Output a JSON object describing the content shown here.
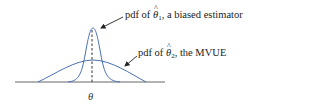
{
  "diagram": {
    "type": "probability density comparison",
    "colors": {
      "curve": "#4a6fb5",
      "axis": "#555555",
      "dashed": "#333333",
      "text": "#222222"
    },
    "curves": [
      {
        "id": "theta1",
        "description": "narrow tall pdf, biased estimator",
        "center_x": 93,
        "peak_y": 28
      },
      {
        "id": "theta2",
        "description": "wide flat pdf, MVUE",
        "center_x": 93,
        "peak_y": 60
      }
    ],
    "labels": {
      "pdf1_prefix": "pdf of ",
      "pdf1_symbol": "θ",
      "pdf1_hat": "^",
      "pdf1_subscript": "1",
      "pdf1_suffix": ", a biased estimator",
      "pdf2_prefix": "pdf of ",
      "pdf2_symbol": "θ",
      "pdf2_hat": "^",
      "pdf2_subscript": "2",
      "pdf2_suffix": ", the MVUE",
      "axis_mark": "θ"
    }
  }
}
